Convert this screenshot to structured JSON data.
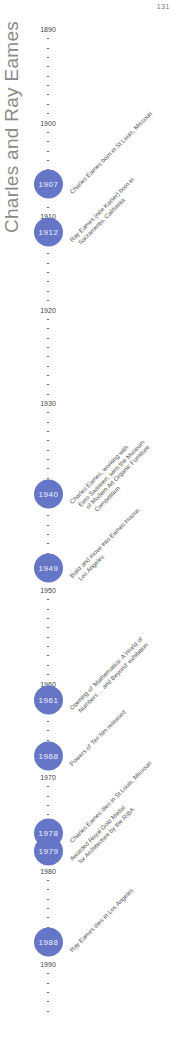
{
  "page_number": "131",
  "title": "Charles and Ray Eames",
  "accent_color": "#6676c6",
  "timeline": {
    "start_year": 1890,
    "end_year": 1995,
    "year_px": 9.35,
    "origin_y": 29,
    "decade_labels": [
      "1890",
      "1900",
      "1910",
      "1920",
      "1930",
      "1940",
      "1950",
      "1960",
      "1970",
      "1980",
      "1990"
    ],
    "events": [
      {
        "year": "1907",
        "y": 184,
        "lines": [
          "Charles Eames born in St Louis, Missouri"
        ]
      },
      {
        "year": "1912",
        "y": 232,
        "lines": [
          "Ray Eames (née Kaiser) born in",
          "Sacramento, California"
        ]
      },
      {
        "year": "1940",
        "y": 494,
        "lines": [
          "Charles Eames, working with",
          "Eero Saarinen, wins the Museum",
          "of Modern Art Organic Furniture",
          "Competition"
        ]
      },
      {
        "year": "1949",
        "y": 568,
        "lines": [
          "Build and move into Eames House,",
          "Los Angeles"
        ]
      },
      {
        "year": "1961",
        "y": 700,
        "lines": [
          "Opening of 'Mathematica: A World of",
          "Numbers ... and Beyond' exhibition"
        ]
      },
      {
        "year": "1968",
        "y": 756,
        "lines": [
          "Powers of Ten film released"
        ]
      },
      {
        "year": "1978",
        "y": 833,
        "lines": [
          "Charles Eames dies in St Louis, Missouri"
        ]
      },
      {
        "year": "1979",
        "y": 851,
        "lines": [
          "Awarded Royal Gold Medal",
          "for Architecture by the RIBA"
        ]
      },
      {
        "year": "1988",
        "y": 942,
        "lines": [
          "Ray Eames dies in Los Angeles"
        ]
      }
    ]
  }
}
